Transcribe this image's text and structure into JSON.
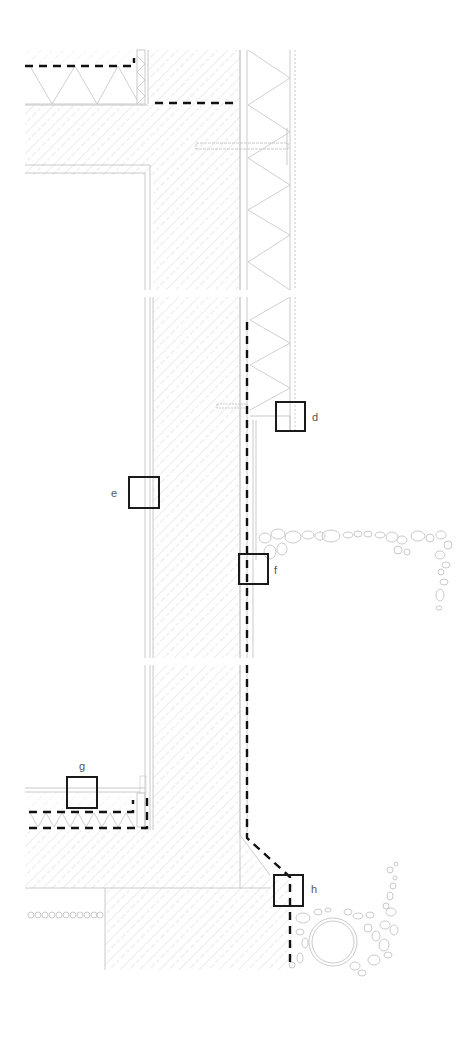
{
  "drawing": {
    "type": "architectural wall section detail",
    "background": "#ffffff",
    "line_color": "#bdbdbd",
    "membrane_color": "#111111",
    "callout_color": "#1a1a1a"
  },
  "callouts": [
    {
      "id": "d",
      "label": "d",
      "x": 276,
      "y": 402,
      "size": 29
    },
    {
      "id": "e",
      "label": "e",
      "x": 129,
      "y": 477,
      "size": 30
    },
    {
      "id": "f",
      "label": "f",
      "x": 239,
      "y": 554,
      "size": 30
    },
    {
      "id": "g",
      "label": "g",
      "x": 67,
      "y": 777,
      "size": 30
    },
    {
      "id": "h",
      "label": "h",
      "x": 274,
      "y": 875,
      "size": 30
    }
  ],
  "labels": {
    "d": "d",
    "e": "e",
    "f": "f",
    "g": "g",
    "h": "h"
  }
}
